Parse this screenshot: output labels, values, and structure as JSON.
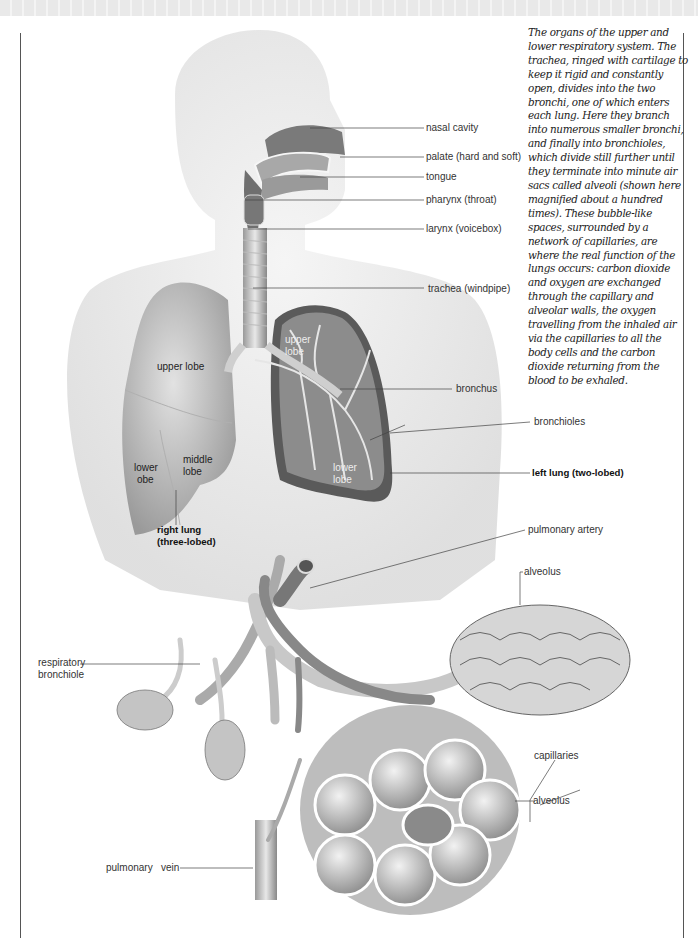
{
  "figure": {
    "caption": "The organs of the upper and lower respiratory system. The trachea, ringed with cartilage to keep it rigid and constantly open, divides into the two bronchi, one of which enters each lung. Here they branch into numerous smaller bronchi, and finally into bronchioles, which divide still further until they terminate into minute air sacs called alveoli (shown here magnified about a hundred times). These bubble-like spaces, surrounded by a network of capillaries, are where the real function of the lungs occurs: carbon dioxide and oxygen are exchanged through the capillary and alveolar walls, the oxygen travelling from the inhaled air via the capillaries to all the body cells and the carbon dioxide returning from the blood to be exhaled."
  },
  "labels": {
    "nasal_cavity": "nasal cavity",
    "palate": "palate (hard and soft)",
    "tongue": "tongue",
    "pharynx": "pharynx (throat)",
    "larynx": "larynx (voicebox)",
    "trachea": "trachea (windpipe)",
    "bronchus": "bronchus",
    "bronchioles": "bronchioles",
    "left_lung": "left lung  (two-lobed)",
    "right_upper_lobe": "upper lobe",
    "right_middle_lobe_1": "middle",
    "right_middle_lobe_2": "lobe",
    "right_lower_lobe_1": "lower",
    "right_lower_lobe_2": "obe",
    "left_upper_lobe_1": "upper",
    "left_upper_lobe_2": "lobe",
    "left_lower_lobe_1": "lower",
    "left_lower_lobe_2": "lobe",
    "right_lung_1": "right lung",
    "right_lung_2": "(three-lobed)",
    "pulmonary_artery": "pulmonary artery",
    "alveolus_top": "alveolus",
    "respiratory_bronchiole_1": "respiratory",
    "respiratory_bronchiole_2": "bronchiole",
    "capillaries": "capillaries",
    "alveolus_bottom": "alveolus",
    "pulmonary_vein": "pulmonary   vein"
  }
}
